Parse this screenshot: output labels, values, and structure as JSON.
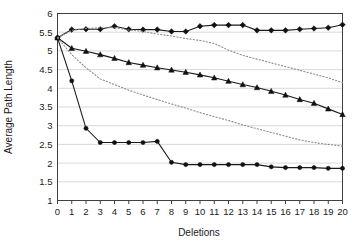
{
  "chart_data": {
    "type": "line",
    "title": "",
    "xlabel": "Deletions",
    "ylabel": "Average Path Length",
    "xlim": [
      0,
      20
    ],
    "ylim": [
      1,
      6
    ],
    "grid": true,
    "legend_position": "none",
    "x": [
      0,
      1,
      2,
      3,
      4,
      5,
      6,
      7,
      8,
      9,
      10,
      11,
      12,
      13,
      14,
      15,
      16,
      17,
      18,
      19,
      20
    ],
    "xticks": [
      "0",
      "1",
      "2",
      "3",
      "4",
      "5",
      "6",
      "7",
      "8",
      "9",
      "10",
      "11",
      "12",
      "13",
      "14",
      "15",
      "16",
      "17",
      "18",
      "19",
      "20"
    ],
    "yticks": [
      "1",
      "1.5",
      "2",
      "2.5",
      "3",
      "3.5",
      "4",
      "4.5",
      "5",
      "5.5",
      "6"
    ],
    "ytick_values": [
      1,
      1.5,
      2,
      2.5,
      3,
      3.5,
      4,
      4.5,
      5,
      5.5,
      6
    ],
    "series": [
      {
        "name": "series-diamond-solid",
        "style": "solid",
        "marker": "diamond",
        "color": "#111111",
        "values": [
          5.35,
          5.57,
          5.58,
          5.58,
          5.66,
          5.58,
          5.57,
          5.57,
          5.52,
          5.52,
          5.66,
          5.69,
          5.69,
          5.69,
          5.55,
          5.55,
          5.55,
          5.58,
          5.6,
          5.62,
          5.7
        ]
      },
      {
        "name": "series-triangle-solid",
        "style": "solid",
        "marker": "triangle",
        "color": "#111111",
        "values": [
          5.35,
          5.07,
          4.99,
          4.9,
          4.8,
          4.69,
          4.62,
          4.55,
          4.49,
          4.43,
          4.36,
          4.28,
          4.19,
          4.1,
          4.02,
          3.92,
          3.82,
          3.7,
          3.6,
          3.45,
          3.3
        ]
      },
      {
        "name": "series-circle-solid",
        "style": "solid",
        "marker": "circle",
        "color": "#111111",
        "values": [
          5.35,
          4.2,
          2.93,
          2.55,
          2.55,
          2.55,
          2.55,
          2.58,
          2.02,
          1.96,
          1.96,
          1.96,
          1.96,
          1.96,
          1.96,
          1.9,
          1.88,
          1.88,
          1.88,
          1.86,
          1.86
        ]
      },
      {
        "name": "series-upper-dotted",
        "style": "dotted",
        "marker": "none",
        "color": "#8c8c8c",
        "values": [
          5.35,
          5.55,
          5.6,
          5.62,
          5.62,
          5.56,
          5.52,
          5.45,
          5.4,
          5.33,
          5.28,
          5.2,
          5.02,
          4.88,
          4.78,
          4.68,
          4.58,
          4.48,
          4.38,
          4.28,
          4.15
        ]
      },
      {
        "name": "series-lower-dotted",
        "style": "dotted",
        "marker": "none",
        "color": "#8c8c8c",
        "values": [
          5.35,
          4.9,
          4.55,
          4.25,
          4.1,
          3.95,
          3.82,
          3.7,
          3.58,
          3.47,
          3.35,
          3.24,
          3.14,
          3.02,
          2.92,
          2.82,
          2.72,
          2.62,
          2.55,
          2.5,
          2.45
        ]
      }
    ]
  }
}
